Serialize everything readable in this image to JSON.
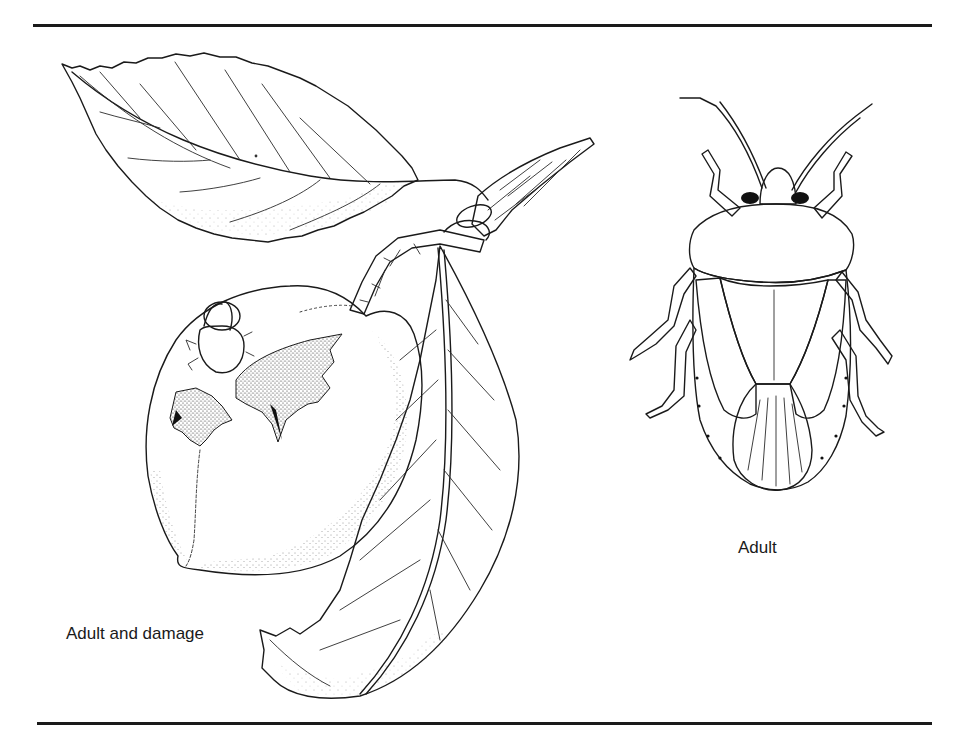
{
  "figure": {
    "captions": {
      "left": "Adult and damage",
      "right": "Adult"
    },
    "illustrations": [
      {
        "id": "fruit-branch",
        "depicts": "peach with feeding damage, leaves and twig, with adult bug on fruit"
      },
      {
        "id": "adult-bug",
        "depicts": "adult stink bug, dorsal view"
      }
    ],
    "colors": {
      "ink": "#1a1a1a",
      "background": "#ffffff"
    }
  }
}
